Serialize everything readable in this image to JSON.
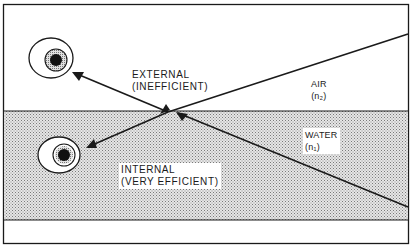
{
  "diagram": {
    "colors": {
      "line": "#1a1a1a",
      "background": "#ffffff",
      "water_fill": "#d9d9d9",
      "stipple": "#8a8a8a"
    },
    "regions": [
      {
        "name": "air",
        "label": "AIR",
        "index_label": "(n₂)"
      },
      {
        "name": "water",
        "label": "WATER",
        "index_label": "(n₁)"
      }
    ],
    "reflections": [
      {
        "name": "external",
        "label": "EXTERNAL",
        "qualifier": "(INEFFICIENT)"
      },
      {
        "name": "internal",
        "label": "INTERNAL",
        "qualifier": "(VERY EFFICIENT)"
      }
    ],
    "icons": [
      "eye-icon-upper",
      "eye-icon-lower"
    ]
  }
}
